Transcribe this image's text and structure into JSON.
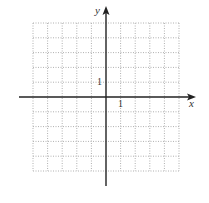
{
  "chart_data": {
    "type": "scatter",
    "title": "",
    "xlabel": "x",
    "ylabel": "y",
    "xlim": [
      -5,
      5
    ],
    "ylim": [
      -5,
      5
    ],
    "grid": true,
    "grid_style": "dotted",
    "tick_labels": {
      "x": "1",
      "y": "1"
    },
    "series": [],
    "colors": {
      "grid": "#b0b0b0",
      "axis": "#222222"
    }
  },
  "axes": {
    "x_label": "x",
    "y_label": "y",
    "x_tick_label": "1",
    "y_tick_label": "1"
  }
}
